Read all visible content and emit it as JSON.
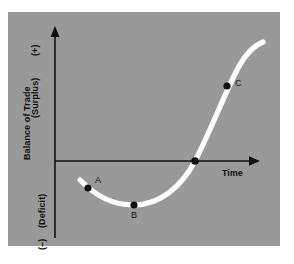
{
  "figure": {
    "background_color": "#ffffff",
    "panel_color": "#999999",
    "curve_color": "#ffffff",
    "axis_color": "#111111",
    "point_color": "#111111",
    "title": ""
  },
  "axes": {
    "y_axis": {
      "name": "Balance of Trade",
      "label": "Balance of Trade",
      "top_sign": "(+)",
      "top_word": "(Surplus)",
      "bottom_sign": "(–)",
      "bottom_word": "(Deficit)"
    },
    "x_axis": {
      "name": "Time",
      "label": "Time"
    }
  },
  "points": [
    {
      "id": "A",
      "label": "A",
      "x": 88,
      "y": 188,
      "label_dx": 6,
      "label_dy": -12
    },
    {
      "id": "B",
      "label": "B",
      "x": 134,
      "y": 205,
      "label_dx": -2,
      "label_dy": 5
    },
    {
      "id": "origin-crossing",
      "label": "",
      "x": 195,
      "y": 161,
      "label_dx": 0,
      "label_dy": 0
    },
    {
      "id": "C",
      "label": "C",
      "x": 227,
      "y": 86,
      "label_dx": 7,
      "label_dy": -11
    }
  ],
  "chart_data": {
    "type": "line",
    "title": "",
    "xlabel": "Time",
    "ylabel": "Balance of Trade",
    "curve_path": "M 80,180 C 96,196 112,205 134,205 C 160,205 182,186 195,161 C 210,132 222,100 236,72 C 244,56 253,46 263,42",
    "grid": false,
    "legend": null,
    "series": [
      {
        "name": "Balance of Trade",
        "points": [
          {
            "t": 0.0,
            "value": -0.2
          },
          {
            "t": 0.3,
            "value": -0.35
          },
          {
            "t": 0.63,
            "value": 0.0
          },
          {
            "t": 0.8,
            "value": 0.53
          },
          {
            "t": 1.0,
            "value": 0.86
          }
        ]
      }
    ],
    "annotations": [
      {
        "label": "A",
        "note": "early deficit on the declining branch"
      },
      {
        "label": "B",
        "note": "trough / maximum deficit"
      },
      {
        "label": "C",
        "note": "surplus on the rising branch"
      }
    ]
  }
}
